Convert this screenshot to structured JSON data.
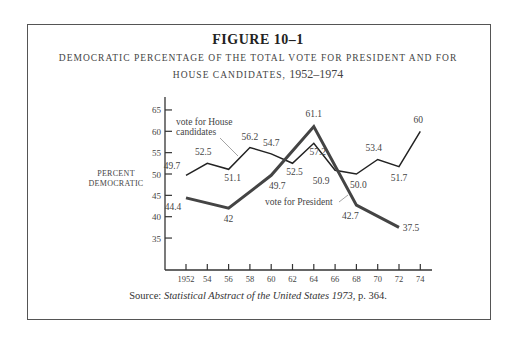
{
  "figure": {
    "title": "FIGURE 10–1",
    "subtitle_line1": "DEMOCRATIC PERCENTAGE OF THE TOTAL VOTE FOR PRESIDENT AND FOR",
    "subtitle_line2_prefix": "HOUSE CANDIDATES, ",
    "subtitle_line2_years": "1952–1974",
    "source_label": "Source: ",
    "source_title": "Statistical Abstract of the United States 1973,",
    "source_page": " p. 364."
  },
  "chart_data": {
    "type": "line",
    "xlabel": "",
    "ylabel": "PERCENT DEMOCRATIC",
    "ylabel_lines": [
      "PERCENT",
      "DEMOCRATIC"
    ],
    "ylim": [
      30,
      68
    ],
    "yticks": [
      35,
      40,
      45,
      50,
      55,
      60,
      65
    ],
    "xticks": [
      1952,
      1954,
      1956,
      1958,
      1960,
      1962,
      1964,
      1966,
      1968,
      1970,
      1972,
      1974
    ],
    "xtick_labels": [
      "1952",
      "54",
      "56",
      "58",
      "60",
      "62",
      "64",
      "66",
      "68",
      "70",
      "72",
      "74"
    ],
    "grid": false,
    "series": [
      {
        "name": "vote for House candidates",
        "label_lines": [
          "vote for House",
          "candidates"
        ],
        "style": "thin",
        "x": [
          1952,
          1954,
          1956,
          1958,
          1960,
          1962,
          1964,
          1966,
          1968,
          1970,
          1972,
          1974
        ],
        "values": [
          49.7,
          52.5,
          51.1,
          56.2,
          54.7,
          52.5,
          57.2,
          50.9,
          50.0,
          53.4,
          51.7,
          60
        ],
        "value_labels": [
          "49.7",
          "52.5",
          "51.1",
          "56.2",
          "54.7",
          "52.5",
          "57.2",
          "50.9",
          "50.0",
          "53.4",
          "51.7",
          "60"
        ]
      },
      {
        "name": "vote for President",
        "label_lines": [
          "vote for President"
        ],
        "style": "thick",
        "x": [
          1952,
          1956,
          1960,
          1964,
          1968,
          1972
        ],
        "values": [
          44.4,
          42,
          49.7,
          61.1,
          42.7,
          37.5
        ],
        "value_labels": [
          "44.4",
          "42",
          "49.7",
          "61.1",
          "42.7",
          "37.5"
        ]
      }
    ]
  }
}
